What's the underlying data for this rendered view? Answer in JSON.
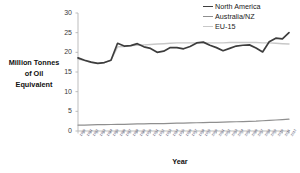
{
  "chart_data": {
    "type": "line",
    "title": "",
    "subtitle": "",
    "xlabel": "Year",
    "ylabel": "Million Tonnes of Oil Equivalent",
    "ylabel_lines": [
      "Million Tonnes",
      "of Oil",
      "Equivalent"
    ],
    "ylim": [
      0,
      30
    ],
    "yticks": [
      0,
      5,
      10,
      15,
      20,
      25,
      30
    ],
    "grid": false,
    "legend_position": "top-right",
    "x": [
      1980,
      1981,
      1982,
      1983,
      1984,
      1985,
      1986,
      1987,
      1988,
      1989,
      1990,
      1991,
      1992,
      1993,
      1994,
      1995,
      1996,
      1997,
      1998,
      1999,
      2000,
      2001,
      2002,
      2003,
      2004,
      2005,
      2006,
      2007,
      2008,
      2009,
      2010,
      2011,
      2012
    ],
    "categories": [
      "1980",
      "1981",
      "1982",
      "1983",
      "1984",
      "1985",
      "1986",
      "1987",
      "1988",
      "1989",
      "1990",
      "1991",
      "1992",
      "1993",
      "1994",
      "1995",
      "1996",
      "1997",
      "1998",
      "1999",
      "2000",
      "2001",
      "2002",
      "2003",
      "2004",
      "2005",
      "2006",
      "2007",
      "2008",
      "2009",
      "2010",
      "2011",
      "2012"
    ],
    "series": [
      {
        "name": "North America",
        "color": "#3d3d3d",
        "width": 1.7,
        "values": [
          18.6,
          18.0,
          17.5,
          17.2,
          17.4,
          18.0,
          22.3,
          21.6,
          21.7,
          22.2,
          21.4,
          21.0,
          20.0,
          20.3,
          21.2,
          21.2,
          20.9,
          21.5,
          22.4,
          22.6,
          21.8,
          21.2,
          20.4,
          21.0,
          21.6,
          21.8,
          21.9,
          21.1,
          20.1,
          22.7,
          23.6,
          23.4,
          25.0
        ]
      },
      {
        "name": "Australia/NZ",
        "color": "#8f8f8f",
        "width": 1.2,
        "values": [
          1.5,
          1.5,
          1.55,
          1.6,
          1.6,
          1.65,
          1.7,
          1.7,
          1.75,
          1.8,
          1.8,
          1.85,
          1.9,
          1.9,
          1.95,
          2.0,
          2.0,
          2.05,
          2.1,
          2.15,
          2.2,
          2.2,
          2.25,
          2.3,
          2.35,
          2.4,
          2.45,
          2.5,
          2.6,
          2.7,
          2.8,
          2.9,
          3.0
        ]
      },
      {
        "name": "EU-15",
        "color": "#c8c8c8",
        "width": 1.4,
        "values": [
          18.3,
          17.9,
          17.4,
          17.2,
          17.4,
          18.0,
          21.4,
          21.5,
          21.7,
          21.8,
          21.9,
          22.0,
          22.1,
          22.2,
          22.3,
          22.4,
          22.4,
          22.4,
          22.4,
          22.4,
          22.4,
          22.4,
          22.4,
          22.5,
          22.5,
          22.5,
          22.5,
          22.5,
          22.4,
          22.4,
          22.3,
          22.2,
          22.1
        ]
      }
    ]
  },
  "legend": {
    "items": [
      {
        "label": "North America",
        "color": "#3d3d3d"
      },
      {
        "label": "Australia/NZ",
        "color": "#8f8f8f"
      },
      {
        "label": "EU-15",
        "color": "#c8c8c8"
      }
    ]
  },
  "axis": {
    "y_label_line1": "Million Tonnes",
    "y_label_line2": "of Oil",
    "y_label_line3": "Equivalent",
    "x_title": "Year",
    "y_ticks": [
      "0",
      "5",
      "10",
      "15",
      "20",
      "25",
      "30"
    ]
  }
}
